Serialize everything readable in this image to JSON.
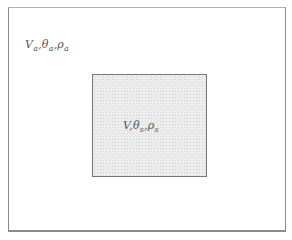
{
  "diagram": {
    "outer_region": {
      "label_parts": [
        {
          "symbol": "V",
          "sub": "a"
        },
        {
          "symbol": "θ",
          "sub": "a"
        },
        {
          "symbol": "ρ",
          "sub": "a"
        }
      ],
      "separator": ","
    },
    "inner_region": {
      "label_parts": [
        {
          "symbol": "V",
          "sub": ""
        },
        {
          "symbol": "θ",
          "sub": "s"
        },
        {
          "symbol": "ρ",
          "sub": "s"
        }
      ],
      "separator": ",",
      "fill": "stippled gray"
    },
    "colors": {
      "border": "#777777",
      "inner_fill": "#f1f1f1",
      "text": "#555555"
    }
  }
}
